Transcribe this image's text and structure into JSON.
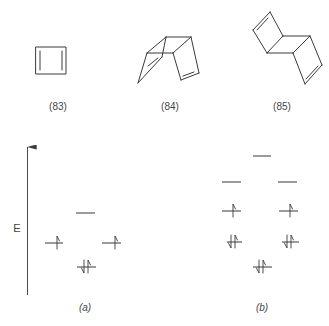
{
  "structures": [
    {
      "id": "83",
      "label": "(83)",
      "description": "cyclobutadiene"
    },
    {
      "id": "84",
      "label": "(84)",
      "description": "syn-tricyclooctadiene dimer"
    },
    {
      "id": "85",
      "label": "(85)",
      "description": "anti-tricyclooctadiene dimer"
    }
  ],
  "energy_axis": {
    "label": "E"
  },
  "diagrams": [
    {
      "id": "a",
      "label": "(a)",
      "levels": [
        {
          "name": "top",
          "electrons": "none"
        },
        {
          "name": "left-degenerate",
          "electrons": "up"
        },
        {
          "name": "right-degenerate",
          "electrons": "up"
        },
        {
          "name": "bottom",
          "electrons": "paired"
        }
      ]
    },
    {
      "id": "b",
      "label": "(b)",
      "levels": [
        {
          "name": "top",
          "electrons": "none"
        },
        {
          "name": "level2-left",
          "electrons": "none"
        },
        {
          "name": "level2-right",
          "electrons": "none"
        },
        {
          "name": "level3-left",
          "electrons": "up"
        },
        {
          "name": "level3-right",
          "electrons": "up"
        },
        {
          "name": "level4-left",
          "electrons": "paired"
        },
        {
          "name": "level4-right",
          "electrons": "paired"
        },
        {
          "name": "bottom",
          "electrons": "paired"
        }
      ]
    }
  ]
}
